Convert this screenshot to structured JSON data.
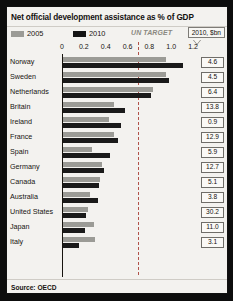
{
  "chart_data": {
    "type": "bar",
    "orientation": "horizontal",
    "title": "Net official development assistance as % of GDP",
    "xlabel": "",
    "ylabel": "",
    "xlim": [
      0,
      1.3
    ],
    "grid": false,
    "legend_position": "top-left",
    "source": "Source: OECD",
    "tick_labels": [
      "0",
      "0.2",
      "0.4",
      "0.6",
      "0.8",
      "1.0",
      "1.2"
    ],
    "tick_values": [
      0,
      0.2,
      0.4,
      0.6,
      0.8,
      1.0,
      1.2
    ],
    "annotations": [
      {
        "name": "un-target",
        "label": "UN TARGET",
        "value": 0.7,
        "style": "dashed-vertical-line"
      }
    ],
    "categories": [
      "Norway",
      "Sweden",
      "Netherlands",
      "Britain",
      "Ireland",
      "France",
      "Spain",
      "Germany",
      "Canada",
      "Australia",
      "United States",
      "Japan",
      "Italy"
    ],
    "series": [
      {
        "name": "2005",
        "color": "#9b9b96",
        "values": [
          0.94,
          0.94,
          0.82,
          0.47,
          0.42,
          0.47,
          0.27,
          0.36,
          0.34,
          0.25,
          0.23,
          0.28,
          0.29
        ]
      },
      {
        "name": "2010",
        "color": "#1a1a1a",
        "values": [
          1.1,
          0.97,
          0.81,
          0.57,
          0.53,
          0.5,
          0.43,
          0.38,
          0.33,
          0.32,
          0.21,
          0.2,
          0.15
        ]
      }
    ],
    "value_column": {
      "header": "2010, $bn",
      "values": [
        "4.6",
        "4.5",
        "6.4",
        "13.8",
        "0.9",
        "12.9",
        "5.9",
        "12.7",
        "5.1",
        "3.8",
        "30.2",
        "11.0",
        "3.1"
      ]
    }
  },
  "legend": {
    "items": [
      {
        "label": "2005",
        "swatch": "light-gray"
      },
      {
        "label": "2010",
        "swatch": "black"
      },
      {
        "label": "UN TARGET",
        "swatch": "none"
      }
    ]
  },
  "callout": {
    "label": "2010, $bn"
  }
}
